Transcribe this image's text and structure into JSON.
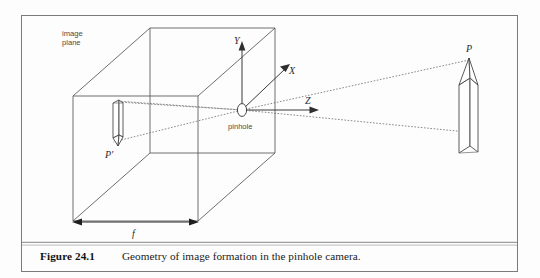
{
  "figure": {
    "caption_label": "Figure 24.1",
    "caption_text": "Geometry of image formation in the pinhole camera.",
    "labels": {
      "image_plane_line1": "image",
      "image_plane_line2": "plane",
      "pinhole": "pinhole",
      "axis_y": "Y",
      "axis_x": "X",
      "axis_z": "Z",
      "point_p": "P",
      "point_p_prime": "P'",
      "focal_length": "f"
    },
    "colors": {
      "background": "#fdfdfd",
      "frame": "#7b7b7b",
      "wireframe": "#555555",
      "ray": "#6b6b6b",
      "axis": "#3a3a3a",
      "label_text": "#4a4a4a",
      "caption_text": "#131313"
    }
  }
}
